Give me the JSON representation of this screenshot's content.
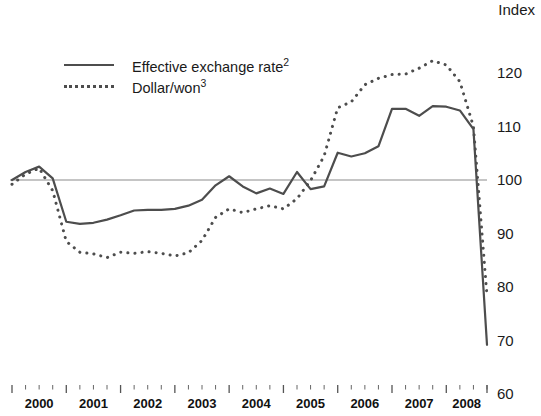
{
  "chart_data": {
    "type": "line",
    "title": "",
    "subtitle": "",
    "xlabel": "",
    "ylabel": "Index",
    "ylim": [
      60,
      125
    ],
    "yticks": [
      120,
      110,
      100,
      90,
      80,
      70,
      60
    ],
    "xlim": [
      "2000",
      "2008-Q4"
    ],
    "xticks": [
      "2000",
      "2001",
      "2002",
      "2003",
      "2004",
      "2005",
      "2006",
      "2007",
      "2008"
    ],
    "minor_ticks_per_year": 4,
    "grid": false,
    "reference_line": 100,
    "legend_position": "top-left",
    "x": [
      "2000-Q1",
      "2000-Q2",
      "2000-Q3",
      "2000-Q4",
      "2001-Q1",
      "2001-Q2",
      "2001-Q3",
      "2001-Q4",
      "2002-Q1",
      "2002-Q2",
      "2002-Q3",
      "2002-Q4",
      "2003-Q1",
      "2003-Q2",
      "2003-Q3",
      "2003-Q4",
      "2004-Q1",
      "2004-Q2",
      "2004-Q3",
      "2004-Q4",
      "2005-Q1",
      "2005-Q2",
      "2005-Q3",
      "2005-Q4",
      "2006-Q1",
      "2006-Q2",
      "2006-Q3",
      "2006-Q4",
      "2007-Q1",
      "2007-Q2",
      "2007-Q3",
      "2007-Q4",
      "2008-Q1",
      "2008-Q2",
      "2008-Q3",
      "2008-Q4"
    ],
    "series": [
      {
        "name": "Effective exchange rate²",
        "style": "solid",
        "color": "#4d4d4d",
        "values": [
          100.0,
          101.5,
          102.5,
          100.3,
          92.2,
          91.8,
          92.0,
          92.6,
          93.4,
          94.3,
          94.4,
          94.4,
          94.6,
          95.2,
          96.3,
          99.0,
          100.7,
          98.8,
          97.5,
          98.4,
          97.4,
          101.5,
          98.3,
          98.8,
          105.1,
          104.4,
          105.0,
          106.3,
          113.3,
          113.3,
          112.0,
          113.8,
          113.7,
          113.0,
          109.5,
          69.2
        ]
      },
      {
        "name": "Dollar/won³",
        "style": "dotted",
        "color": "#4d4d4d",
        "values": [
          99.2,
          101.1,
          102.2,
          98.0,
          88.5,
          86.5,
          86.2,
          85.5,
          86.5,
          86.3,
          86.6,
          86.3,
          85.8,
          86.4,
          88.7,
          93.0,
          94.6,
          93.9,
          94.6,
          95.2,
          94.6,
          96.5,
          99.9,
          104.5,
          113.5,
          114.6,
          117.8,
          119.0,
          119.7,
          119.8,
          120.9,
          122.3,
          121.5,
          118.4,
          110.0,
          78.3
        ]
      }
    ]
  },
  "axis": {
    "unit_label": "Index",
    "y_tick_labels": [
      "120",
      "110",
      "100",
      "90",
      "80",
      "70",
      "60"
    ],
    "x_tick_labels": [
      "2000",
      "2001",
      "2002",
      "2003",
      "2004",
      "2005",
      "2006",
      "2007",
      "2008"
    ]
  },
  "legend": {
    "items": [
      {
        "label_text": "Effective exchange rate",
        "superscript": "2",
        "style": "solid"
      },
      {
        "label_text": "Dollar/won",
        "superscript": "3",
        "style": "dotted"
      }
    ]
  },
  "colors": {
    "line": "#4d4d4d",
    "reference_line": "#8c8c8c",
    "tick": "#555555",
    "text": "#1a1a1a"
  }
}
